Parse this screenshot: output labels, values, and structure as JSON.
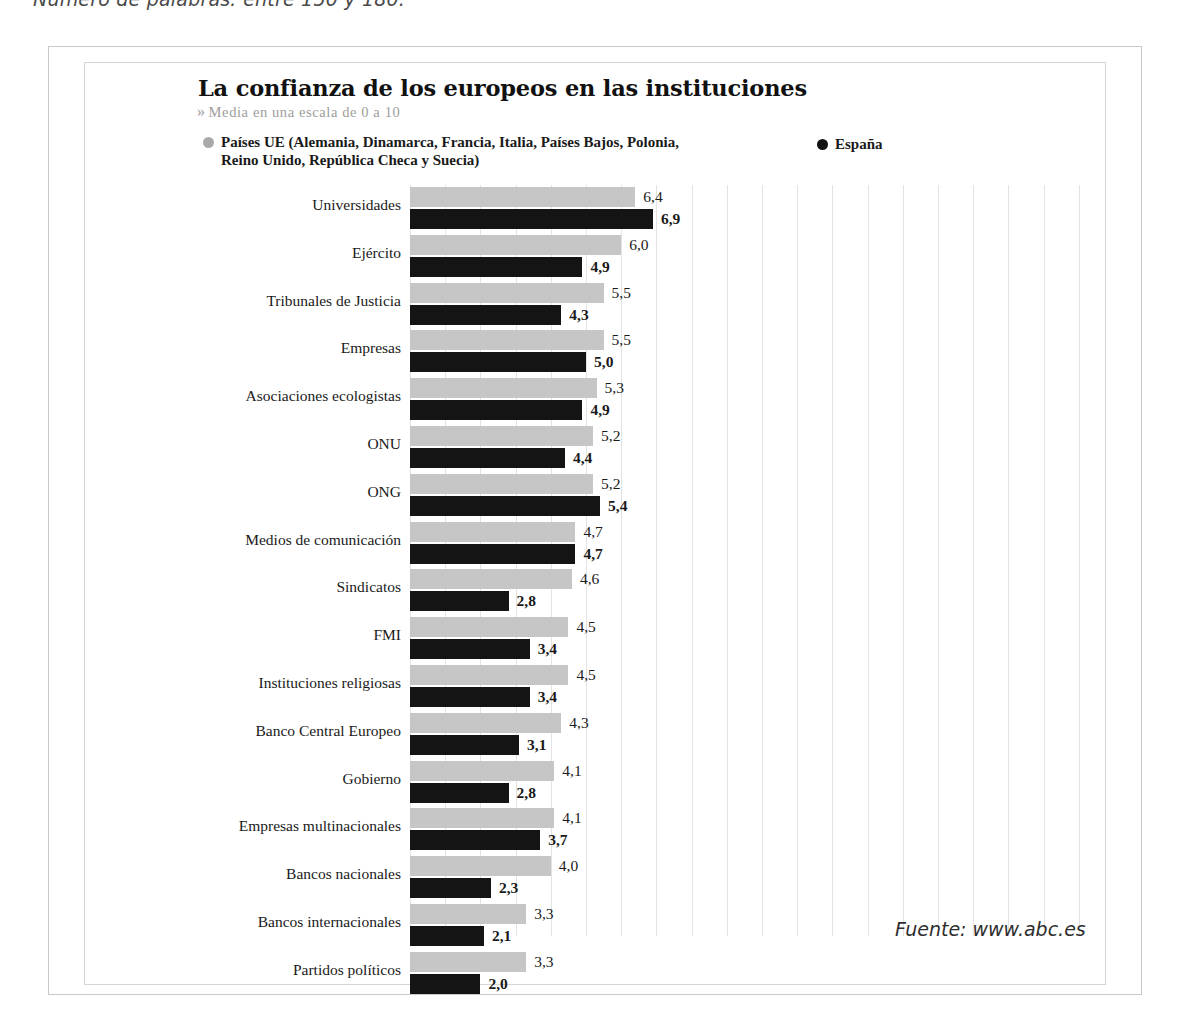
{
  "page": {
    "note": "Número de palabras: entre 150 y 180."
  },
  "header": {
    "title": "La confianza de los europeos en las instituciones",
    "subtitle_chevron": "»",
    "subtitle": "Media en una escala de 0 a 10"
  },
  "legend": {
    "eu": {
      "label": "Países UE (Alemania, Dinamarca, Francia, Italia, Países Bajos, Polonia, Reino Unido, República Checa y Suecia)",
      "color": "#a9a9a9"
    },
    "es": {
      "label": "España",
      "color": "#111111"
    }
  },
  "source": "Fuente: www.abc.es",
  "chart_data": {
    "type": "bar",
    "orientation": "horizontal",
    "title": "La confianza de los europeos en las instituciones",
    "subtitle": "Media en una escala de 0 a 10",
    "xlabel": "",
    "ylabel": "",
    "xlim": [
      0,
      10
    ],
    "grid": true,
    "grid_step": 1,
    "legend_position": "top",
    "value_decimal_separator": ",",
    "categories": [
      "Universidades",
      "Ejército",
      "Tribunales de Justicia",
      "Empresas",
      "Asociaciones ecologistas",
      "ONU",
      "ONG",
      "Medios de comunicación",
      "Sindicatos",
      "FMI",
      "Instituciones religiosas",
      "Banco Central Europeo",
      "Gobierno",
      "Empresas multinacionales",
      "Bancos nacionales",
      "Bancos internacionales",
      "Partidos políticos"
    ],
    "series": [
      {
        "name": "Países UE (Alemania, Dinamarca, Francia, Italia, Países Bajos, Polonia, Reino Unido, República Checa y Suecia)",
        "short_name": "Países UE",
        "color": "#c6c6c6",
        "values": [
          6.4,
          6.0,
          5.5,
          5.5,
          5.3,
          5.2,
          5.2,
          4.7,
          4.6,
          4.5,
          4.5,
          4.3,
          4.1,
          4.1,
          4.0,
          3.3,
          3.3
        ],
        "labels": [
          "6,4",
          "6,0",
          "5,5",
          "5,5",
          "5,3",
          "5,2",
          "5,2",
          "4,7",
          "4,6",
          "4,5",
          "4,5",
          "4,3",
          "4,1",
          "4,1",
          "4,0",
          "3,3",
          "3,3"
        ]
      },
      {
        "name": "España",
        "short_name": "España",
        "color": "#141414",
        "values": [
          6.9,
          4.9,
          4.3,
          5.0,
          4.9,
          4.4,
          5.4,
          4.7,
          2.8,
          3.4,
          3.4,
          3.1,
          2.8,
          3.7,
          2.3,
          2.1,
          2.0
        ],
        "labels": [
          "6,9",
          "4,9",
          "4,3",
          "5,0",
          "4,9",
          "4,4",
          "5,4",
          "4,7",
          "2,8",
          "3,4",
          "3,4",
          "3,1",
          "2,8",
          "3,7",
          "2,3",
          "2,1",
          "2,0"
        ]
      }
    ]
  }
}
